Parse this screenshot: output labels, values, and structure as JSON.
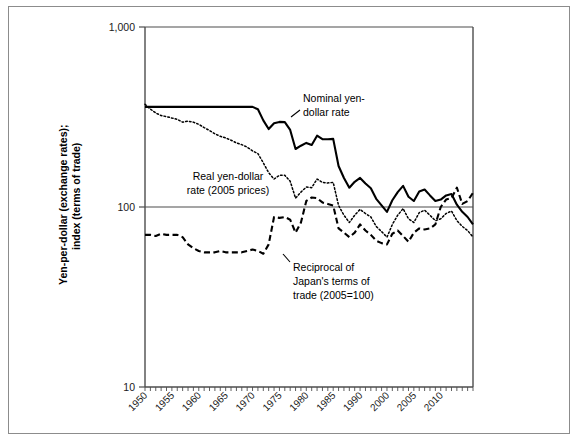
{
  "chart_data": {
    "type": "line",
    "title": "",
    "xlabel": "",
    "ylabel": "Yen-per-dollar (exchange rates); index (terms of trade)",
    "ylabel_line1": "Yen-per-dollar (exchange rates);",
    "ylabel_line2": "index (terms of trade)",
    "yscale": "log",
    "ylim": [
      10,
      1000
    ],
    "ytick_labels": [
      "1,000",
      "100",
      "10"
    ],
    "ytick_values": [
      1000,
      100,
      10
    ],
    "xlim": [
      1950,
      2011
    ],
    "xtick_labels": [
      "1950",
      "1955",
      "1960",
      "1965",
      "1970",
      "1975",
      "1980",
      "1985",
      "1990",
      "2000",
      "2005",
      "2010"
    ],
    "xtick_values": [
      1950,
      1955,
      1960,
      1965,
      1970,
      1975,
      1980,
      1985,
      1990,
      1995,
      2000,
      2005
    ],
    "minor_ticks": "annual",
    "grid": "horizontal gridlines at 1000 and 100",
    "legend": "inline annotations",
    "annotations": [
      {
        "name": "nominal-yen-dollar-rate",
        "lines": [
          "Nominal yen-",
          "dollar rate"
        ],
        "x": 2000,
        "y": 430
      },
      {
        "name": "real-yen-dollar-rate",
        "lines": [
          "Real yen-dollar",
          "rate (2005 prices)"
        ],
        "x": 1967,
        "y": 135
      },
      {
        "name": "reciprocal-terms-of-trade",
        "lines": [
          "Reciprocal of",
          "Japan's terms of",
          "trade (2005=100)"
        ],
        "x": 1988,
        "y": 40
      }
    ],
    "series": [
      {
        "name": "Nominal yen-dollar rate",
        "style": "solid",
        "x": [
          1950,
          1951,
          1952,
          1953,
          1954,
          1955,
          1956,
          1957,
          1958,
          1959,
          1960,
          1961,
          1962,
          1963,
          1964,
          1965,
          1966,
          1967,
          1968,
          1969,
          1970,
          1971,
          1972,
          1973,
          1974,
          1975,
          1976,
          1977,
          1978,
          1979,
          1980,
          1981,
          1982,
          1983,
          1984,
          1985,
          1986,
          1987,
          1988,
          1989,
          1990,
          1991,
          1992,
          1993,
          1994,
          1995,
          1996,
          1997,
          1998,
          1999,
          2000,
          2001,
          2002,
          2003,
          2004,
          2005,
          2006,
          2007,
          2008,
          2009,
          2010,
          2011
        ],
        "values": [
          360,
          360,
          360,
          360,
          360,
          360,
          360,
          360,
          360,
          360,
          360,
          360,
          360,
          360,
          360,
          360,
          360,
          360,
          360,
          360,
          360,
          349,
          303,
          271,
          292,
          297,
          296,
          268,
          210,
          219,
          227,
          221,
          249,
          238,
          238,
          239,
          169,
          145,
          128,
          138,
          145,
          135,
          127,
          111,
          102,
          94,
          109,
          121,
          131,
          114,
          108,
          122,
          125,
          116,
          108,
          110,
          116,
          118,
          103,
          94,
          88,
          80
        ]
      },
      {
        "name": "Real yen-dollar rate (2005 prices)",
        "style": "dotted",
        "x": [
          1950,
          1951,
          1952,
          1953,
          1954,
          1955,
          1956,
          1957,
          1958,
          1959,
          1960,
          1961,
          1962,
          1963,
          1964,
          1965,
          1966,
          1967,
          1968,
          1969,
          1970,
          1971,
          1972,
          1973,
          1974,
          1975,
          1976,
          1977,
          1978,
          1979,
          1980,
          1981,
          1982,
          1983,
          1984,
          1985,
          1986,
          1987,
          1988,
          1989,
          1990,
          1991,
          1992,
          1993,
          1994,
          1995,
          1996,
          1997,
          1998,
          1999,
          2000,
          2001,
          2002,
          2003,
          2004,
          2005,
          2006,
          2007,
          2008,
          2009,
          2010,
          2011
        ],
        "values": [
          372,
          350,
          333,
          322,
          318,
          312,
          307,
          296,
          300,
          296,
          288,
          276,
          266,
          255,
          247,
          242,
          235,
          227,
          222,
          215,
          205,
          198,
          176,
          155,
          143,
          150,
          150,
          139,
          112,
          121,
          129,
          128,
          143,
          137,
          136,
          137,
          102,
          90,
          82,
          90,
          97,
          92,
          88,
          78,
          73,
          68,
          80,
          90,
          98,
          86,
          82,
          93,
          96,
          90,
          84,
          86,
          92,
          95,
          84,
          78,
          74,
          68
        ]
      },
      {
        "name": "Reciprocal of Japan's terms of trade (2005=100)",
        "style": "dashed",
        "x": [
          1950,
          1951,
          1952,
          1953,
          1954,
          1955,
          1956,
          1957,
          1958,
          1959,
          1960,
          1961,
          1962,
          1963,
          1964,
          1965,
          1966,
          1967,
          1968,
          1969,
          1970,
          1971,
          1972,
          1973,
          1974,
          1975,
          1976,
          1977,
          1978,
          1979,
          1980,
          1981,
          1982,
          1983,
          1984,
          1985,
          1986,
          1987,
          1988,
          1989,
          1990,
          1991,
          1992,
          1993,
          1994,
          1995,
          1996,
          1997,
          1998,
          1999,
          2000,
          2001,
          2002,
          2003,
          2004,
          2005,
          2006,
          2007,
          2008,
          2009,
          2010,
          2011
        ],
        "values": [
          70,
          70,
          69,
          71,
          70,
          70,
          70,
          68,
          62,
          59,
          57,
          56,
          56,
          56,
          57,
          56,
          56,
          56,
          56,
          57,
          58,
          57,
          55,
          62,
          88,
          87,
          88,
          85,
          72,
          82,
          108,
          113,
          112,
          106,
          104,
          102,
          76,
          72,
          68,
          72,
          80,
          74,
          70,
          65,
          63,
          62,
          71,
          74,
          69,
          64,
          72,
          76,
          75,
          76,
          80,
          100,
          110,
          112,
          128,
          104,
          108,
          120
        ]
      }
    ]
  }
}
